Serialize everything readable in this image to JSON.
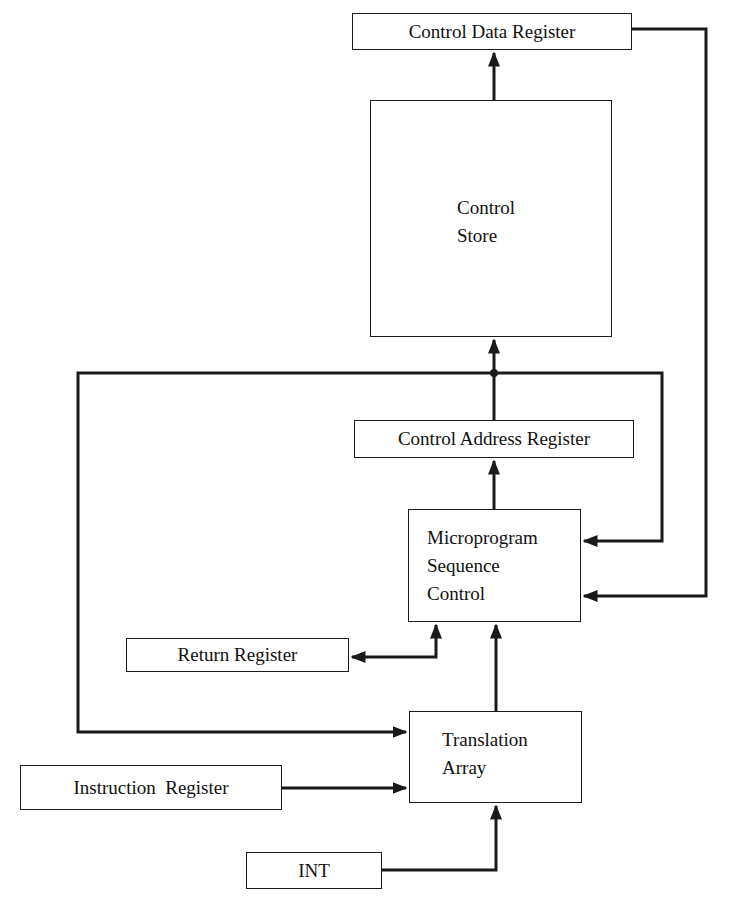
{
  "diagram": {
    "title": "",
    "boxes": {
      "control_data_register": "Control Data Register",
      "control_store": {
        "line1": "Control",
        "line2": "Store"
      },
      "control_address_register": "Control Address Register",
      "microprogram_sequence_control": {
        "line1": "Microprogram",
        "line2": "Sequence",
        "line3": "Control"
      },
      "return_register": "Return Register",
      "translation_array": {
        "line1": "Translation",
        "line2": "Array"
      },
      "instruction_register": "Instruction  Register",
      "int": "INT"
    },
    "connections": [
      {
        "from": "Control Store",
        "to": "Control Data Register"
      },
      {
        "from": "Control Data Register",
        "to": "Microprogram Sequence Control"
      },
      {
        "from": "Control Address Register",
        "to": "Control Store"
      },
      {
        "from": "Control Address Register",
        "to": "Microprogram Sequence Control"
      },
      {
        "from": "Control Address Register",
        "to": "Translation Array"
      },
      {
        "from": "Microprogram Sequence Control",
        "to": "Control Address Register"
      },
      {
        "from": "Microprogram Sequence Control",
        "to": "Return Register"
      },
      {
        "from": "Return Register",
        "to": "Microprogram Sequence Control"
      },
      {
        "from": "Translation Array",
        "to": "Microprogram Sequence Control"
      },
      {
        "from": "Instruction Register",
        "to": "Translation Array"
      },
      {
        "from": "INT",
        "to": "Translation Array"
      }
    ],
    "colors": {
      "line": "#1a1a1a",
      "background": "#ffffff"
    }
  }
}
